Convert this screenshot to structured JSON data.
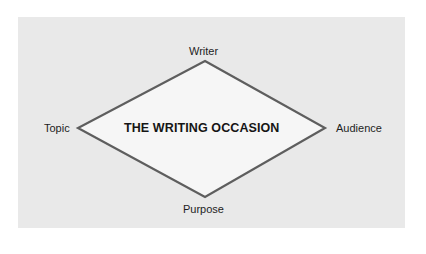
{
  "diagram": {
    "title": "THE WRITING OCCASION",
    "nodes": {
      "top": "Writer",
      "left": "Topic",
      "right": "Audience",
      "bottom": "Purpose"
    },
    "colors": {
      "panel": "#e9e9e9",
      "diamond_fill": "#f6f6f6",
      "diamond_stroke": "#5e5e5e",
      "text": "#1e1e1e"
    }
  }
}
